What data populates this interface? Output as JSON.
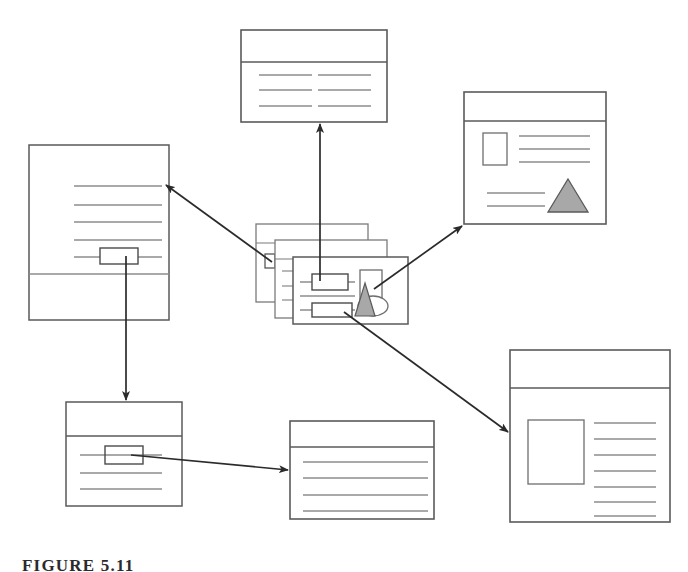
{
  "figure": {
    "caption": "FIGURE 5.11",
    "caption_clipped": true,
    "background_color": "#ffffff",
    "stroke_color": "#6e6e6e",
    "dark_stroke_color": "#4a4a4a",
    "arrow_color": "#2b2b2b",
    "shape_fill_gray": "#a8a8a8",
    "width": 688,
    "height": 572
  },
  "diagram": {
    "type": "node-link-document-map",
    "node_count": 7,
    "arrow_count": 6,
    "nodes": [
      {
        "id": "center-stack",
        "name": "center-document-stack",
        "label": "Source document stack",
        "x": 256,
        "y": 224,
        "w": 152,
        "h": 100,
        "stacked": true,
        "stack_depth": 3,
        "stack_offset_x": 20,
        "stack_offset_y": 18,
        "header_band": true,
        "text_lines": 3,
        "highlight_rects": 2,
        "has_image_box": true,
        "has_triangle": true,
        "has_ellipse": true
      },
      {
        "id": "top",
        "name": "top-document",
        "label": "Top destination document",
        "x": 241,
        "y": 30,
        "w": 146,
        "h": 92,
        "header_band": true,
        "columns": 2,
        "lines_per_column": 3
      },
      {
        "id": "top-right",
        "name": "top-right-document",
        "label": "Top-right destination document",
        "x": 464,
        "y": 92,
        "w": 142,
        "h": 132,
        "header_band": true,
        "has_image_box": true,
        "text_lines_right": 3,
        "text_lines_bottom": 2,
        "has_triangle": true
      },
      {
        "id": "left",
        "name": "left-document",
        "label": "Left destination document (portrait)",
        "x": 29,
        "y": 145,
        "w": 140,
        "h": 175,
        "orientation": "portrait",
        "text_lines": 5,
        "highlight_rects": 1,
        "footer_divider": true
      },
      {
        "id": "bottom-left",
        "name": "bottom-left-document",
        "label": "Bottom-left document",
        "x": 66,
        "y": 402,
        "w": 116,
        "h": 104,
        "header_band": true,
        "text_lines": 3,
        "highlight_rects": 1
      },
      {
        "id": "bottom-center",
        "name": "bottom-center-document",
        "label": "Bottom-center destination document",
        "x": 290,
        "y": 421,
        "w": 144,
        "h": 98,
        "header_band": true,
        "text_lines": 4
      },
      {
        "id": "bottom-right",
        "name": "bottom-right-document",
        "label": "Bottom-right destination document",
        "x": 510,
        "y": 350,
        "w": 160,
        "h": 172,
        "header_band": true,
        "has_image_box": true,
        "text_lines": 7
      }
    ],
    "arrows": [
      {
        "id": "a1",
        "name": "arrow-stack-to-top",
        "from": "center-stack",
        "to": "top",
        "x1": 320,
        "y1": 281,
        "x2": 320,
        "y2": 124,
        "style": "straight-vertical"
      },
      {
        "id": "a2",
        "name": "arrow-stack-to-left",
        "from": "center-stack",
        "to": "left",
        "x1": 272,
        "y1": 262,
        "x2": 166,
        "y2": 185,
        "style": "straight-diagonal"
      },
      {
        "id": "a3",
        "name": "arrow-stack-to-top-right",
        "from": "center-stack",
        "to": "top-right",
        "x1": 374,
        "y1": 289,
        "x2": 462,
        "y2": 226,
        "style": "straight-diagonal"
      },
      {
        "id": "a4",
        "name": "arrow-stack-to-bottom-right",
        "from": "center-stack",
        "to": "bottom-right",
        "x1": 344,
        "y1": 312,
        "x2": 508,
        "y2": 432,
        "style": "straight-diagonal"
      },
      {
        "id": "a5",
        "name": "arrow-left-to-bottom-left",
        "from": "left",
        "to": "bottom-left",
        "x1": 126,
        "y1": 256,
        "x2": 126,
        "y2": 400,
        "style": "straight-vertical"
      },
      {
        "id": "a6",
        "name": "arrow-bottom-left-to-bottom-center",
        "from": "bottom-left",
        "to": "bottom-center",
        "x1": 131,
        "y1": 455,
        "x2": 288,
        "y2": 470,
        "style": "straight-diagonal"
      }
    ]
  }
}
